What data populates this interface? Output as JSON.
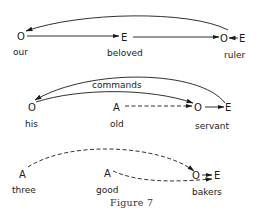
{
  "figure": {
    "caption": "Figure 7",
    "rows": [
      {
        "nodes": [
          {
            "symbol": "O",
            "word": "our"
          },
          {
            "symbol": "E",
            "word": "beloved"
          },
          {
            "symbol": "O",
            "word": ""
          },
          {
            "symbol": "E",
            "word": "ruler"
          }
        ],
        "edges": [
          {
            "from": "our O",
            "to": "beloved E",
            "style": "solid"
          },
          {
            "from": "beloved E",
            "to": "ruler O",
            "style": "solid"
          },
          {
            "from": "ruler E",
            "to": "ruler O",
            "style": "solid"
          },
          {
            "from": "ruler O",
            "to": "our O",
            "style": "solid-curved"
          }
        ]
      },
      {
        "arc_label": "commands",
        "nodes": [
          {
            "symbol": "O",
            "word": "his"
          },
          {
            "symbol": "A",
            "word": "old"
          },
          {
            "symbol": "O",
            "word": ""
          },
          {
            "symbol": "E",
            "word": "servant"
          }
        ],
        "edges": [
          {
            "from": "servant E",
            "to": "his O",
            "style": "solid-curved"
          },
          {
            "from": "his O",
            "to": "servant O",
            "style": "solid-curved",
            "label": "commands"
          },
          {
            "from": "old A",
            "to": "servant O",
            "style": "dashed"
          },
          {
            "from": "servant O",
            "to": "servant E",
            "style": "solid"
          }
        ]
      },
      {
        "nodes": [
          {
            "symbol": "A",
            "word": "three"
          },
          {
            "symbol": "A",
            "word": "good"
          },
          {
            "symbol": "O",
            "word": ""
          },
          {
            "symbol": "E",
            "word": "bakers"
          }
        ],
        "edges": [
          {
            "from": "three A",
            "to": "bakers O",
            "style": "dashed-curved"
          },
          {
            "from": "good A",
            "to": "bakers E",
            "style": "dashed-curved"
          },
          {
            "from": "bakers O",
            "to": "bakers E",
            "style": "solid"
          }
        ]
      }
    ]
  }
}
